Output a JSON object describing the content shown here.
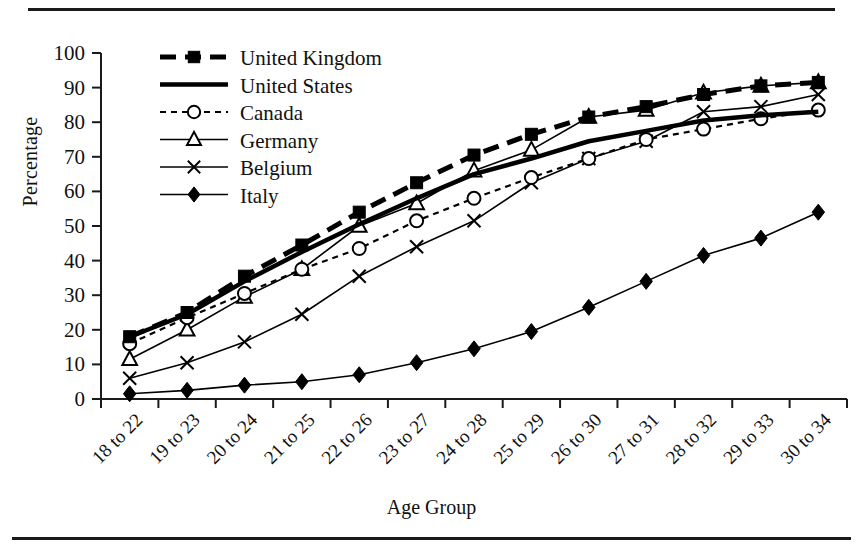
{
  "chart_data": {
    "type": "line",
    "title": "",
    "xlabel": "Age Group",
    "ylabel": "Percentage",
    "ylim": [
      0,
      100
    ],
    "ytick_step": 10,
    "grid": false,
    "legend_position": "top-left-inside",
    "categories": [
      "18 to 22",
      "19 to 23",
      "20 to 24",
      "21 to 25",
      "22 to 26",
      "23 to 27",
      "24 to 28",
      "25 to 29",
      "26 to 30",
      "27 to 31",
      "28 to 32",
      "29 to 33",
      "30 to 34"
    ],
    "yticks": [
      0,
      10,
      20,
      30,
      40,
      50,
      60,
      70,
      80,
      90,
      100
    ],
    "series": [
      {
        "name": "United Kingdom",
        "marker": "filled-square",
        "line": "dashed",
        "color": "#000000",
        "values": [
          18,
          25,
          35.5,
          44.5,
          54,
          62.5,
          70.5,
          76.5,
          81.5,
          84.5,
          88,
          90.5,
          91.5
        ]
      },
      {
        "name": "United States",
        "marker": "none",
        "line": "solid-thick",
        "color": "#000000",
        "values": [
          18,
          24.5,
          34,
          42.5,
          50.5,
          58,
          65,
          69.5,
          74.5,
          77.5,
          80.5,
          82,
          83
        ]
      },
      {
        "name": "Canada",
        "marker": "open-circle",
        "line": "dotted",
        "color": "#000000",
        "values": [
          16,
          23.5,
          30.5,
          37.5,
          43.5,
          51.5,
          58,
          64,
          69.5,
          75,
          78,
          81,
          83.5
        ]
      },
      {
        "name": "Germany",
        "marker": "open-triangle",
        "line": "solid-thin",
        "color": "#000000",
        "values": [
          11.5,
          20,
          29.5,
          37.5,
          50,
          56.5,
          66,
          72,
          81.5,
          83.5,
          88.5,
          90.5,
          91.5
        ]
      },
      {
        "name": "Belgium",
        "marker": "cross-x",
        "line": "solid-thin",
        "color": "#000000",
        "values": [
          6,
          10.5,
          16.5,
          24.5,
          35.5,
          44,
          51.5,
          62.5,
          69.5,
          74.5,
          83,
          84.5,
          88
        ]
      },
      {
        "name": "Italy",
        "marker": "filled-diamond",
        "line": "solid-thin",
        "color": "#000000",
        "values": [
          1.5,
          2.5,
          4,
          5,
          7,
          10.5,
          14.5,
          19.5,
          26.5,
          34,
          41.5,
          46.5,
          54
        ]
      }
    ]
  }
}
